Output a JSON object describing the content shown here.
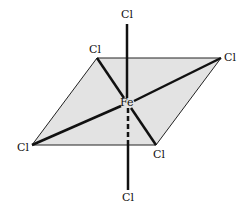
{
  "diagram": {
    "colors": {
      "plane_fill": "#e3e3e3",
      "line": "#111111",
      "background": "#ffffff"
    },
    "center_atom": {
      "label": "Fe",
      "x": 127,
      "y": 103
    },
    "ligands": [
      {
        "id": "axial-top",
        "label": "Cl",
        "x": 127,
        "y": 24,
        "label_x": 121,
        "label_y": 18
      },
      {
        "id": "eq-back-left",
        "label": "Cl",
        "x": 97,
        "y": 58,
        "label_x": 88,
        "label_y": 53
      },
      {
        "id": "eq-back-right",
        "label": "Cl",
        "x": 221,
        "y": 58,
        "label_x": 224,
        "label_y": 61
      },
      {
        "id": "eq-front-left",
        "label": "Cl",
        "x": 32,
        "y": 145,
        "label_x": 17,
        "label_y": 151
      },
      {
        "id": "eq-front-right",
        "label": "Cl",
        "x": 156,
        "y": 145,
        "label_x": 153,
        "label_y": 158
      },
      {
        "id": "axial-bottom",
        "label": "Cl",
        "x": 128,
        "y": 190,
        "label_x": 122,
        "label_y": 201
      }
    ],
    "plane": {
      "points": "97,58 221,58 156,145 32,145"
    }
  }
}
